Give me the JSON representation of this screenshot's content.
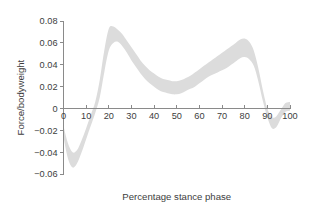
{
  "chart_data": {
    "type": "area",
    "title": "",
    "xlabel": "Percentage stance phase",
    "ylabel": "Force/bodyweight",
    "xlim": [
      0,
      100
    ],
    "ylim": [
      -0.06,
      0.08
    ],
    "grid": false,
    "legend": null,
    "x_ticks": [
      0,
      10,
      20,
      30,
      40,
      50,
      60,
      70,
      80,
      90,
      100
    ],
    "x_tick_labels": [
      "0",
      "10",
      "20",
      "30",
      "40",
      "50",
      "60",
      "70",
      "80",
      "90",
      "100"
    ],
    "y_ticks": [
      -0.06,
      -0.04,
      -0.02,
      0,
      0.02,
      0.04,
      0.06,
      0.08
    ],
    "y_tick_labels": [
      "-0.06",
      "-0.04",
      "-0.02",
      "0",
      "0.02",
      "0.04",
      "0.06",
      "0.08"
    ],
    "band_color": "#dcdcdc",
    "axis_color": "#8a8a8a",
    "text_color": "#3d3d3d",
    "x": [
      0,
      2,
      4,
      6,
      8,
      10,
      12,
      14,
      16,
      18,
      20,
      22,
      24,
      26,
      28,
      30,
      32,
      34,
      36,
      38,
      40,
      42,
      44,
      46,
      48,
      50,
      52,
      54,
      56,
      58,
      60,
      62,
      64,
      66,
      68,
      70,
      72,
      74,
      76,
      78,
      80,
      82,
      84,
      86,
      88,
      90,
      92,
      94,
      96,
      98,
      100
    ],
    "series": [
      {
        "name": "mean",
        "values": [
          -0.021,
          -0.039,
          -0.047,
          -0.044,
          -0.034,
          -0.023,
          -0.011,
          0.001,
          0.018,
          0.043,
          0.063,
          0.068,
          0.067,
          0.063,
          0.057,
          0.05,
          0.044,
          0.038,
          0.033,
          0.029,
          0.026,
          0.023,
          0.021,
          0.02,
          0.019,
          0.019,
          0.02,
          0.022,
          0.024,
          0.026,
          0.029,
          0.032,
          0.035,
          0.037,
          0.04,
          0.042,
          0.045,
          0.048,
          0.051,
          0.054,
          0.055,
          0.053,
          0.046,
          0.031,
          0.012,
          -0.004,
          -0.013,
          -0.012,
          -0.005,
          0.001,
          0.002
        ]
      },
      {
        "name": "upper_bound",
        "values": [
          -0.016,
          -0.032,
          -0.04,
          -0.038,
          -0.029,
          -0.018,
          -0.006,
          0.006,
          0.026,
          0.053,
          0.073,
          0.075,
          0.072,
          0.068,
          0.062,
          0.056,
          0.05,
          0.044,
          0.039,
          0.035,
          0.032,
          0.029,
          0.027,
          0.026,
          0.025,
          0.025,
          0.026,
          0.028,
          0.03,
          0.033,
          0.036,
          0.039,
          0.042,
          0.045,
          0.048,
          0.051,
          0.054,
          0.057,
          0.06,
          0.063,
          0.064,
          0.061,
          0.053,
          0.037,
          0.017,
          0.0,
          -0.008,
          -0.007,
          -0.001,
          0.005,
          0.006
        ]
      },
      {
        "name": "lower_bound",
        "values": [
          -0.026,
          -0.046,
          -0.054,
          -0.05,
          -0.04,
          -0.028,
          -0.016,
          -0.004,
          0.01,
          0.033,
          0.053,
          0.06,
          0.061,
          0.057,
          0.051,
          0.044,
          0.038,
          0.032,
          0.027,
          0.023,
          0.02,
          0.017,
          0.015,
          0.014,
          0.013,
          0.013,
          0.014,
          0.016,
          0.018,
          0.02,
          0.023,
          0.026,
          0.029,
          0.031,
          0.033,
          0.035,
          0.037,
          0.04,
          0.043,
          0.046,
          0.047,
          0.045,
          0.039,
          0.025,
          0.007,
          -0.008,
          -0.018,
          -0.017,
          -0.009,
          -0.003,
          -0.002
        ]
      }
    ]
  }
}
